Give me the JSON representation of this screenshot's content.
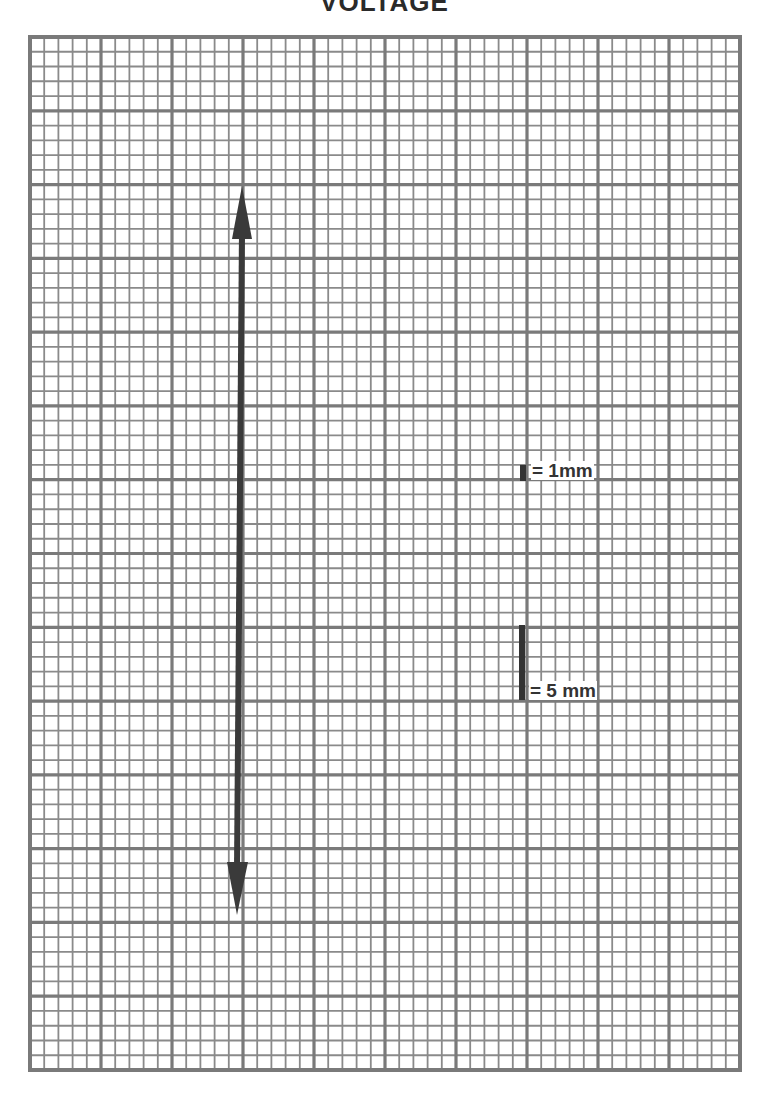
{
  "title": "VOLTAGE",
  "grid": {
    "left": 30,
    "top": 37,
    "width": 710,
    "height": 1033,
    "major_cols": 10,
    "major_rows": 14,
    "minor_per_major": 5,
    "line_color": "#8a8a8a",
    "major_line_color": "#7a7a7a"
  },
  "arrow": {
    "label": "voltage-amplitude-arrow",
    "top_tip": [
      242,
      186
    ],
    "bottom_tip": [
      237,
      915
    ],
    "color": "#3a3a3a"
  },
  "scale_legend": {
    "small_marker": {
      "text": "= 1mm",
      "value": "1",
      "unit": "mm"
    },
    "large_marker": {
      "text": "= 5 mm",
      "value": "5",
      "unit": "mm"
    },
    "marker_color": "#333333"
  }
}
